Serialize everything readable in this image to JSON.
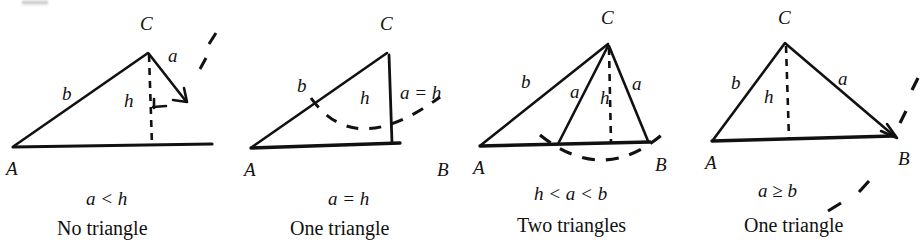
{
  "figure": {
    "background_color": "#ffffff",
    "ink_color": "#111111",
    "vertex_labels": {
      "A": "A",
      "B": "B",
      "C": "C"
    },
    "side_labels": {
      "a": "a",
      "b": "b",
      "h": "h",
      "a_equals_h": "a = h"
    },
    "cases": [
      {
        "id": "case-no-triangle",
        "condition": "a < h",
        "result": "No triangle",
        "vertices": [
          "A",
          "C"
        ],
        "has_vertex_b": false,
        "side_labels_shown": [
          "b",
          "h",
          "a"
        ],
        "altitude_style": "dashed",
        "has_right_angle_mark": true,
        "arc_style": "dashed-short",
        "swing_side_count": 1
      },
      {
        "id": "case-one-triangle-right",
        "condition": "a = h",
        "result": "One triangle",
        "vertices": [
          "A",
          "B",
          "C"
        ],
        "has_vertex_b": true,
        "side_labels_shown": [
          "b",
          "h",
          "a = h"
        ],
        "altitude_style": "solid",
        "has_right_angle_mark": false,
        "arc_style": "dashed-arc",
        "swing_side_count": 1
      },
      {
        "id": "case-two-triangles",
        "condition": "h < a < b",
        "result": "Two triangles",
        "vertices": [
          "A",
          "B",
          "C"
        ],
        "has_vertex_b": true,
        "side_labels_shown": [
          "b",
          "a",
          "h",
          "a"
        ],
        "altitude_style": "dashed",
        "has_right_angle_mark": false,
        "arc_style": "dashed-arc",
        "swing_side_count": 2
      },
      {
        "id": "case-one-triangle-obtuse",
        "condition": "a ≥ b",
        "result": "One triangle",
        "vertices": [
          "A",
          "B",
          "C"
        ],
        "has_vertex_b": true,
        "side_labels_shown": [
          "b",
          "h",
          "a"
        ],
        "altitude_style": "dashed",
        "has_right_angle_mark": false,
        "arc_style": "dashed-arc",
        "swing_side_count": 1
      }
    ]
  }
}
